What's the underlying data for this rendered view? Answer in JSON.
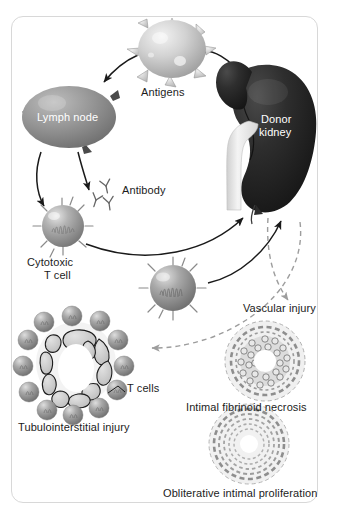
{
  "figure": {
    "title_visible": false,
    "background_color": "#ffffff",
    "border_color": "#d8d8d8"
  },
  "palette": {
    "antigen_cell": "#c9c9c9",
    "lymph_node": "#8f8f8f",
    "donor_kidney": "#2b2b2b",
    "ureter": "#e8e8e8",
    "t_cell": "#9a9a9a",
    "arrow_solid": "#1a1a1a",
    "arrow_dashed": "#9d9d9d",
    "tubule_cell": "#cfcfcf",
    "vessel_wall": "#b5b5b5",
    "label_text": "#1c1c1c",
    "label_on_dark": "#ffffff"
  },
  "labels": {
    "antigens": "Antigens",
    "lymph_node": "Lymph node",
    "donor_kidney_line1": "Donor",
    "donor_kidney_line2": "kidney",
    "antibody": "Antibody",
    "cytotoxic_line1": "Cytotoxic",
    "cytotoxic_line2": "T cell",
    "vascular_injury": "Vascular injury",
    "t_cells": "T cells",
    "tubulointerstitial_injury": "Tubulointerstitial injury",
    "intimal_fibrinoid_necrosis": "Intimal fibrinoid necrosis",
    "obliterative_intimal_proliferation": "Obliterative intimal proliferation"
  },
  "elements": {
    "antigen_cell": {
      "name": "antigen-presenting-cell",
      "spikes": 8
    },
    "lymph_node": {
      "name": "lymph-node"
    },
    "donor_kidney": {
      "name": "donor-kidney"
    },
    "antibody_molecules": {
      "name": "antibody-y-molecules",
      "count": 3
    },
    "cytotoxic_t_cell": {
      "name": "cytotoxic-t-cell"
    },
    "effector_t_cell": {
      "name": "effector-t-cell"
    },
    "tubule_lesion": {
      "name": "tubulointerstitial-lesion",
      "surrounding_t_cells": 13,
      "tubule_epithelial_cells": 10
    },
    "necrosis_lesion": {
      "name": "intimal-fibrinoid-necrosis-lesion"
    },
    "proliferation_lesion": {
      "name": "obliterative-intimal-proliferation-lesion"
    }
  },
  "arrows": [
    {
      "name": "kidney-to-antigens",
      "style": "solid",
      "from": "donor-kidney",
      "to": "antigen-cell"
    },
    {
      "name": "antigens-to-lymph-node",
      "style": "solid",
      "from": "antigen-cell",
      "to": "lymph-node"
    },
    {
      "name": "lymph-node-to-cytotoxic-t-cell",
      "style": "solid",
      "from": "lymph-node",
      "to": "cytotoxic-t-cell"
    },
    {
      "name": "lymph-node-to-antibody",
      "style": "solid",
      "from": "lymph-node",
      "to": "antibody"
    },
    {
      "name": "cytotoxic-t-cell-to-kidney",
      "style": "solid",
      "from": "cytotoxic-t-cell",
      "to": "donor-kidney"
    },
    {
      "name": "effector-t-cell-to-kidney",
      "style": "solid",
      "from": "effector-t-cell",
      "to": "donor-kidney"
    },
    {
      "name": "kidney-to-vascular-injury",
      "style": "dashed",
      "from": "donor-kidney",
      "to": "intimal-fibrinoid-necrosis"
    },
    {
      "name": "kidney-to-tubulointerstitial-injury",
      "style": "dashed",
      "from": "donor-kidney",
      "to": "tubulointerstitial-injury"
    }
  ]
}
